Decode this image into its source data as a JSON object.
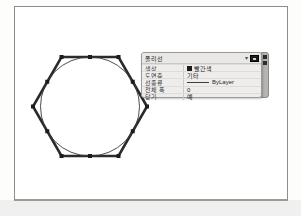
{
  "drawing": {
    "description": "selected hexagonal polyline with inscribed circle",
    "shape_primary": "hexagon-polyline",
    "shape_secondary": "inscribed-circle",
    "grip_count": 12,
    "stroke_color": "#2b2b2b",
    "grip_color": "#1c1c1c"
  },
  "quick_properties": {
    "title": "폴리선",
    "icons": {
      "dropdown": "▾",
      "customize": "customize-grid",
      "strip_top": "close",
      "strip_bottom": "options"
    },
    "rows": [
      {
        "label": "색상",
        "value": "빨간색",
        "swatch": "#1b1b1b"
      },
      {
        "label": "도면층",
        "value": "기타"
      },
      {
        "label": "선종류",
        "value": "ByLayer",
        "preview": "solid-line"
      },
      {
        "label": "전체 폭",
        "value": "0"
      },
      {
        "label": "닫기",
        "value": "예"
      }
    ]
  },
  "colors": {
    "panel_bg": "#eeedeb",
    "panel_border": "#9a9a97",
    "sheet_border": "#8d8d8d",
    "strip_bg": "#b5b4b1",
    "page_bg": "#ffffff"
  }
}
